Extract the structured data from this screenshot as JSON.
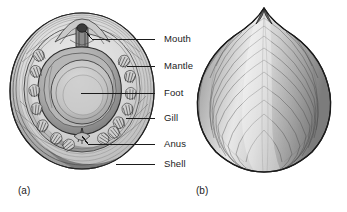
{
  "figure": {
    "background_color": "#ffffff",
    "ink_color": "#1b1b1b",
    "shell_tone": "#b9b9b9"
  },
  "panels": [
    {
      "id": "a",
      "caption": "(a)",
      "view": "ventral view with labeled anatomy",
      "caption_x": 18,
      "caption_y": 186
    },
    {
      "id": "b",
      "caption": "(b)",
      "view": "dorsal shell view",
      "caption_x": 196,
      "caption_y": 186
    }
  ],
  "labels": [
    {
      "name": "mouth",
      "text": "Mouth",
      "text_x": 164,
      "text_y": 35,
      "leader_x1": 155,
      "leader_y1": 39,
      "leader_x2": 92,
      "leader_y2": 39,
      "target_x": 85,
      "target_y": 30
    },
    {
      "name": "mantle",
      "text": "Mantle",
      "text_x": 164,
      "text_y": 62,
      "leader_x1": 155,
      "leader_y1": 66,
      "leader_x2": 127,
      "leader_y2": 66,
      "target_x": 127,
      "target_y": 66
    },
    {
      "name": "foot",
      "text": "Foot",
      "text_x": 164,
      "text_y": 89,
      "leader_x1": 155,
      "leader_y1": 93,
      "leader_x2": 81,
      "leader_y2": 93,
      "target_x": 81,
      "target_y": 93
    },
    {
      "name": "gill",
      "text": "Gill",
      "text_x": 164,
      "text_y": 114,
      "leader_x1": 155,
      "leader_y1": 118,
      "leader_x2": 126,
      "leader_y2": 118,
      "target_x": 126,
      "target_y": 118
    },
    {
      "name": "anus",
      "text": "Anus",
      "text_x": 164,
      "text_y": 140,
      "leader_x1": 155,
      "leader_y1": 144,
      "leader_x2": 88,
      "leader_y2": 144,
      "target_x": 82,
      "target_y": 136
    },
    {
      "name": "shell",
      "text": "Shell",
      "text_x": 164,
      "text_y": 160,
      "leader_x1": 155,
      "leader_y1": 164,
      "leader_x2": 116,
      "leader_y2": 164,
      "target_x": 116,
      "target_y": 164
    }
  ],
  "ventral_anatomy": {
    "shell_rings": 6,
    "mantle_label": "mantle ring",
    "foot_label": "central foot",
    "gill_count_left": 5,
    "gill_count_right": 5,
    "gill_count_bottom": 4,
    "mouth_label": "mouth with projecting lip",
    "anus_label": "posterior anus"
  },
  "dorsal_shell": {
    "growth_lines": 22,
    "apex_label": "anterior apex",
    "outline_label": "cap-shaped shell outline"
  }
}
